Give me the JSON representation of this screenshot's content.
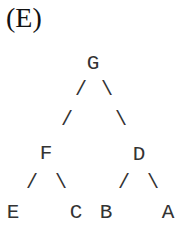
{
  "panel_label": "(E)",
  "tree": {
    "root": "G",
    "nodes": {
      "G": {
        "label": "G",
        "children": [
          "F",
          "D"
        ]
      },
      "F": {
        "label": "F",
        "children": [
          "E",
          "C"
        ]
      },
      "D": {
        "label": "D",
        "children": [
          "B",
          "A"
        ]
      },
      "E": {
        "label": "E",
        "children": []
      },
      "C": {
        "label": "C",
        "children": []
      },
      "B": {
        "label": "B",
        "children": []
      },
      "A": {
        "label": "A",
        "children": []
      }
    },
    "edge_glyphs": {
      "left": "/",
      "right": "\\"
    }
  }
}
